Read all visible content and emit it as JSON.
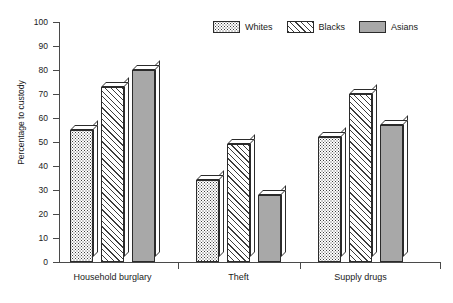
{
  "chart_data": {
    "type": "bar",
    "title": "",
    "xlabel": "",
    "ylabel": "Percentage to custody",
    "categories": [
      "Household burglary",
      "Theft",
      "Supply drugs"
    ],
    "series": [
      {
        "name": "Whites",
        "pattern": "dots",
        "values": [
          55,
          34,
          52
        ]
      },
      {
        "name": "Blacks",
        "pattern": "hatch",
        "values": [
          73,
          49,
          70
        ]
      },
      {
        "name": "Asians",
        "pattern": "solid",
        "values": [
          80,
          28,
          57
        ]
      }
    ],
    "ylim": [
      0,
      100
    ],
    "yticks": [
      0,
      10,
      20,
      30,
      40,
      50,
      60,
      70,
      80,
      90,
      100
    ],
    "ytick_labels": [
      "0",
      "10",
      "20",
      "30",
      "40",
      "50",
      "60",
      "70",
      "80",
      "90",
      "100"
    ],
    "grid": false,
    "legend_position": "top-right",
    "colors": {
      "axis": "#4a4a4a",
      "bar_outline": "#2b2b2b",
      "pattern_ink": "#3d3d3d",
      "asians_fill": "#a8a8a8",
      "background": "#ffffff",
      "text": "#1a1a1a"
    }
  },
  "legend": {
    "items": [
      {
        "label": "Whites"
      },
      {
        "label": "Blacks"
      },
      {
        "label": "Asians"
      }
    ]
  },
  "axes": {
    "y_title": "Percentage to custody",
    "y_labels": [
      "100",
      "90",
      "80",
      "70",
      "60",
      "50",
      "40",
      "30",
      "20",
      "10",
      "0"
    ],
    "x_labels": [
      "Household burglary",
      "Theft",
      "Supply drugs"
    ]
  }
}
